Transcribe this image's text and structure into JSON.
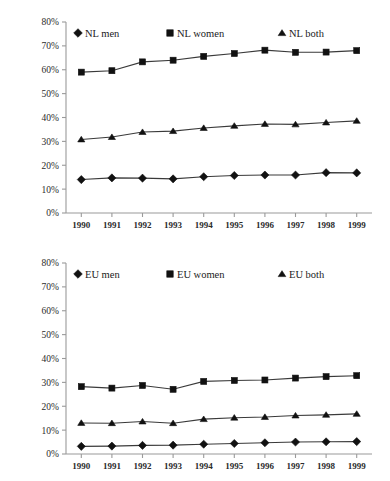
{
  "chart_data": [
    {
      "type": "line",
      "title": "",
      "xlabel": "",
      "ylabel": "",
      "grid": false,
      "legend_position": "top-inside",
      "ylim": [
        0,
        80
      ],
      "ytick_labels": [
        "0%",
        "10%",
        "20%",
        "30%",
        "40%",
        "50%",
        "60%",
        "70%",
        "80%"
      ],
      "ytick_values": [
        0,
        10,
        20,
        30,
        40,
        50,
        60,
        70,
        80
      ],
      "categories": [
        "1990",
        "1991",
        "1992",
        "1993",
        "1994",
        "1995",
        "1996",
        "1997",
        "1998",
        "1999"
      ],
      "series": [
        {
          "name": "NL men",
          "marker": "diamond",
          "values": [
            14.0,
            14.7,
            14.6,
            14.3,
            15.2,
            15.7,
            15.9,
            15.9,
            16.9,
            16.8
          ]
        },
        {
          "name": "NL women",
          "marker": "square",
          "values": [
            59.0,
            59.6,
            63.3,
            64.0,
            65.6,
            66.8,
            68.2,
            67.3,
            67.4,
            68.0
          ]
        },
        {
          "name": "NL both",
          "marker": "triangle",
          "values": [
            30.8,
            31.8,
            33.9,
            34.3,
            35.6,
            36.5,
            37.3,
            37.1,
            37.9,
            38.6
          ]
        }
      ]
    },
    {
      "type": "line",
      "title": "",
      "xlabel": "",
      "ylabel": "",
      "grid": false,
      "legend_position": "top-inside",
      "ylim": [
        0,
        80
      ],
      "ytick_labels": [
        "0%",
        "10%",
        "20%",
        "30%",
        "40%",
        "50%",
        "60%",
        "70%",
        "80%"
      ],
      "ytick_values": [
        0,
        10,
        20,
        30,
        40,
        50,
        60,
        70,
        80
      ],
      "categories": [
        "1990",
        "1991",
        "1992",
        "1993",
        "1994",
        "1995",
        "1996",
        "1997",
        "1998",
        "1999"
      ],
      "series": [
        {
          "name": "EU men",
          "marker": "diamond",
          "values": [
            3.2,
            3.3,
            3.6,
            3.7,
            4.1,
            4.4,
            4.7,
            5.0,
            5.1,
            5.2
          ]
        },
        {
          "name": "EU women",
          "marker": "square",
          "values": [
            28.2,
            27.6,
            28.7,
            27.1,
            30.4,
            30.8,
            31.0,
            31.8,
            32.4,
            32.8
          ]
        },
        {
          "name": "EU both",
          "marker": "triangle",
          "values": [
            13.0,
            12.9,
            13.6,
            12.9,
            14.6,
            15.2,
            15.5,
            16.1,
            16.4,
            16.8
          ]
        }
      ]
    }
  ],
  "charts": [
    {
      "id": "nl-chart",
      "legend": [
        {
          "label": "NL men",
          "marker": "diamond"
        },
        {
          "label": "NL women",
          "marker": "square"
        },
        {
          "label": "NL both",
          "marker": "triangle"
        }
      ]
    },
    {
      "id": "eu-chart",
      "legend": [
        {
          "label": "EU men",
          "marker": "diamond"
        },
        {
          "label": "EU women",
          "marker": "square"
        },
        {
          "label": "EU both",
          "marker": "triangle"
        }
      ]
    }
  ],
  "colors": {
    "axis": "#9a9a9a",
    "line": "#3a3a3a",
    "marker": "#111111",
    "text": "#1a1a1a",
    "background": "#ffffff"
  }
}
